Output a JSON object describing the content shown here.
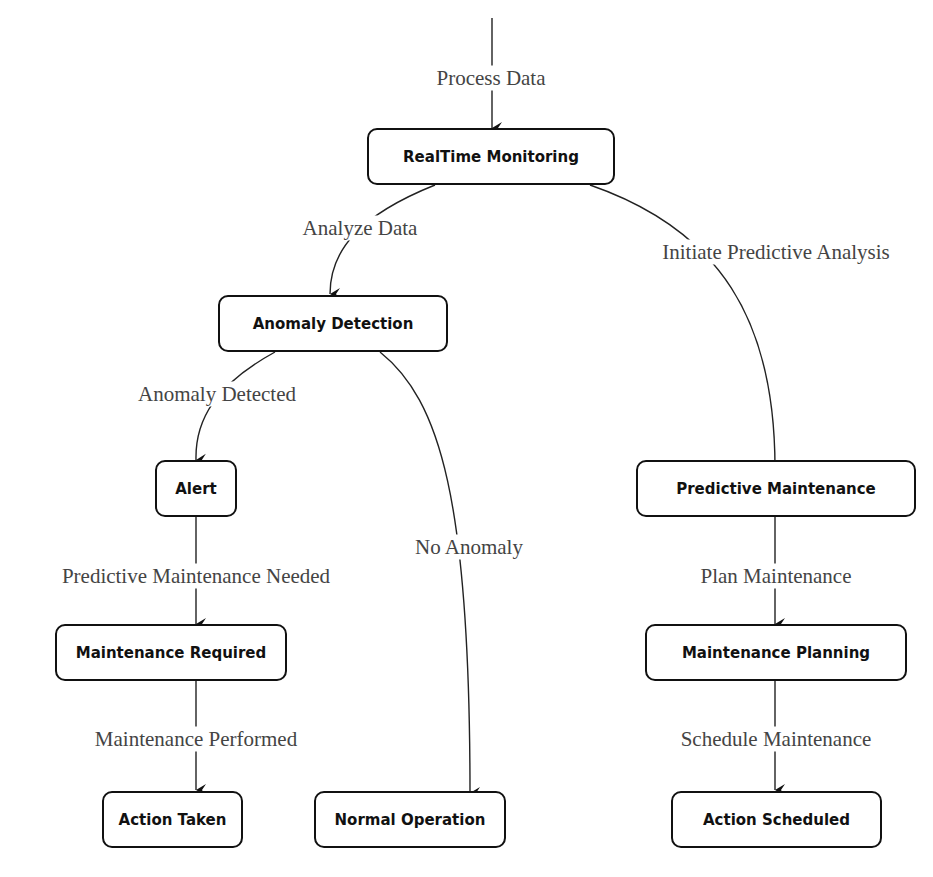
{
  "diagram": {
    "type": "flowchart",
    "nodes": {
      "realtime_monitoring": "RealTime Monitoring",
      "anomaly_detection": "Anomaly Detection",
      "alert": "Alert",
      "maintenance_required": "Maintenance Required",
      "action_taken": "Action Taken",
      "normal_operation": "Normal Operation",
      "predictive_maintenance": "Predictive Maintenance",
      "maintenance_planning": "Maintenance Planning",
      "action_scheduled": "Action Scheduled"
    },
    "edges": {
      "process_data": "Process Data",
      "analyze_data": "Analyze Data",
      "initiate_predictive_analysis": "Initiate Predictive Analysis",
      "anomaly_detected": "Anomaly Detected",
      "no_anomaly": "No Anomaly",
      "predictive_maintenance_needed": "Predictive Maintenance Needed",
      "maintenance_performed": "Maintenance Performed",
      "plan_maintenance": "Plan Maintenance",
      "schedule_maintenance": "Schedule Maintenance"
    },
    "connections": [
      {
        "from": "(entry)",
        "to": "RealTime Monitoring",
        "label": "Process Data"
      },
      {
        "from": "RealTime Monitoring",
        "to": "Anomaly Detection",
        "label": "Analyze Data"
      },
      {
        "from": "RealTime Monitoring",
        "to": "Predictive Maintenance",
        "label": "Initiate Predictive Analysis"
      },
      {
        "from": "Anomaly Detection",
        "to": "Alert",
        "label": "Anomaly Detected"
      },
      {
        "from": "Anomaly Detection",
        "to": "Normal Operation",
        "label": "No Anomaly"
      },
      {
        "from": "Alert",
        "to": "Maintenance Required",
        "label": "Predictive Maintenance Needed"
      },
      {
        "from": "Maintenance Required",
        "to": "Action Taken",
        "label": "Maintenance Performed"
      },
      {
        "from": "Predictive Maintenance",
        "to": "Maintenance Planning",
        "label": "Plan Maintenance"
      },
      {
        "from": "Maintenance Planning",
        "to": "Action Scheduled",
        "label": "Schedule Maintenance"
      }
    ]
  }
}
